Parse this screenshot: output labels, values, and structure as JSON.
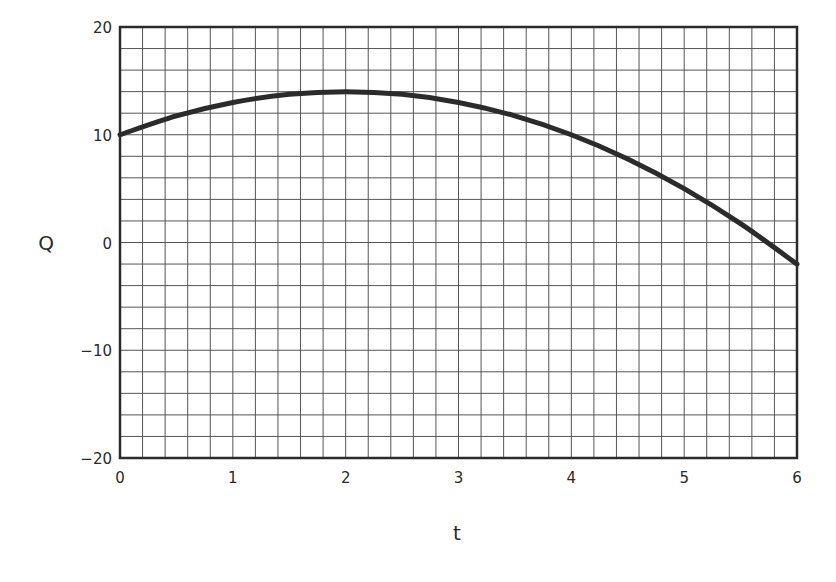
{
  "chart_data": {
    "type": "line",
    "title": "",
    "xlabel": "t",
    "ylabel": "Q",
    "xlim": [
      0,
      6
    ],
    "ylim": [
      -20,
      20
    ],
    "grid": true,
    "x_minor_step": 0.2,
    "y_minor_step": 2,
    "x_ticks": [
      0,
      1,
      2,
      3,
      4,
      5,
      6
    ],
    "x_tick_labels": [
      "0",
      "1",
      "2",
      "3",
      "4",
      "5",
      "6"
    ],
    "y_ticks": [
      20,
      10,
      0,
      -10,
      -20
    ],
    "y_tick_labels": [
      "20",
      "10",
      "0",
      "−10",
      "−20"
    ],
    "series": [
      {
        "name": "Q(t)",
        "equation": "Q = 10 + 4t - t^2",
        "x": [
          0,
          0.5,
          1,
          1.5,
          2,
          2.5,
          3,
          3.5,
          4,
          4.5,
          5,
          5.5,
          6
        ],
        "values": [
          10,
          11.75,
          13,
          13.75,
          14,
          13.75,
          13,
          11.75,
          10,
          7.75,
          5,
          1.75,
          -2
        ],
        "color": "#2b2b2b"
      }
    ],
    "legend": null
  },
  "colors": {
    "curve": "#2b2b2b",
    "frame": "#2b2b2b",
    "grid": "#555555",
    "text": "#2b2b2b"
  }
}
